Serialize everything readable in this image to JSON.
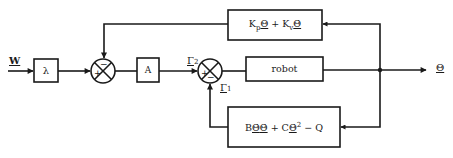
{
  "diagram": {
    "type": "control-block-diagram",
    "input": {
      "label": "W"
    },
    "output": {
      "label": "Θ"
    },
    "blocks": [
      {
        "id": "lambda",
        "label": "λ"
      },
      {
        "id": "A",
        "label": "A"
      },
      {
        "id": "robot",
        "label": "robot"
      },
      {
        "id": "pd-feedback",
        "label_parts": [
          "K",
          "p",
          "Θ",
          " + ",
          "K",
          "v",
          "Θ̇"
        ]
      },
      {
        "id": "dynamics-feedback",
        "label_parts": [
          "B",
          "Θ̇",
          "Θ̇",
          " + C",
          "Θ̇",
          "2",
          " − Q"
        ]
      }
    ],
    "summing_junctions": [
      {
        "id": "sum1",
        "plus": "+",
        "minus": "−"
      },
      {
        "id": "sum2",
        "plus": "+",
        "minus": "−"
      }
    ],
    "signals": [
      {
        "id": "gamma2",
        "label": "Γ",
        "sub": "2"
      },
      {
        "id": "gamma1",
        "label": "Γ",
        "sub": "1"
      }
    ],
    "edges": [
      [
        "W",
        "lambda"
      ],
      [
        "lambda",
        "sum1(+)"
      ],
      [
        "pd-feedback",
        "sum1(-)"
      ],
      [
        "sum1",
        "A"
      ],
      [
        "A",
        "sum2(+) [Γ2]"
      ],
      [
        "dynamics-feedback",
        "sum2(-) [Γ1]"
      ],
      [
        "sum2",
        "robot"
      ],
      [
        "robot",
        "Θ"
      ],
      [
        "Θ",
        "pd-feedback"
      ],
      [
        "Θ",
        "dynamics-feedback"
      ]
    ]
  }
}
